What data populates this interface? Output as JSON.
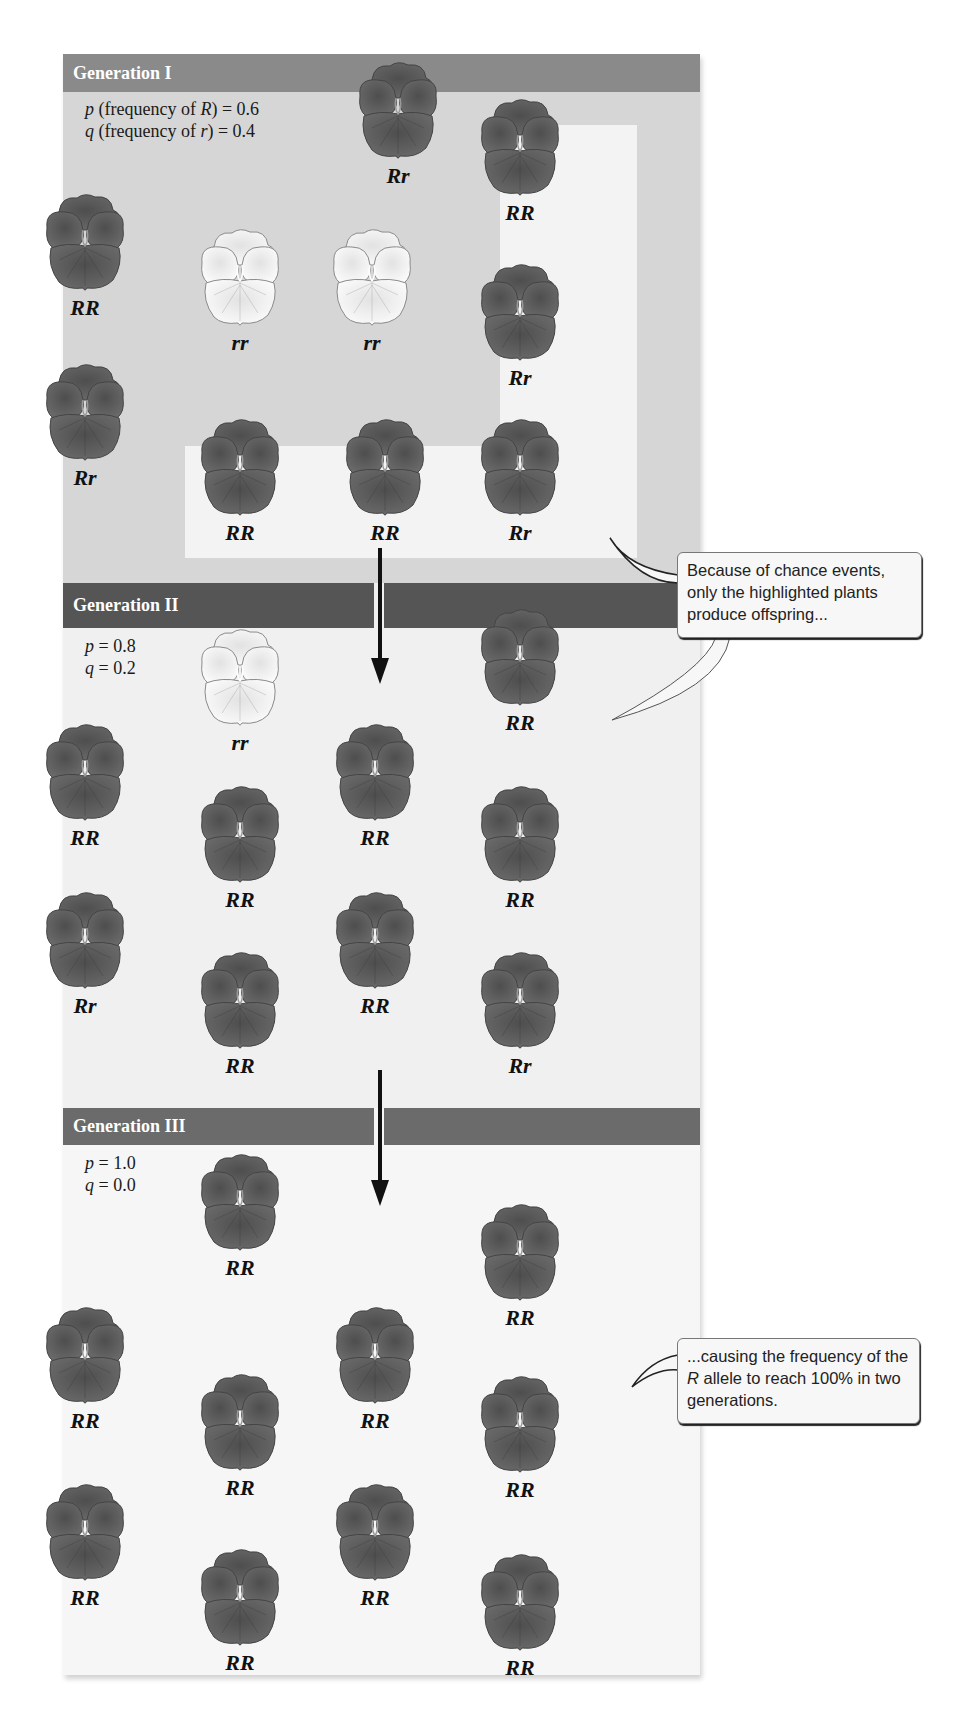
{
  "figure": {
    "generations": [
      {
        "title": "Generation I",
        "p_line": {
          "var": "p",
          "text": " (frequency of ",
          "allele": "R",
          "value": ") = 0.6"
        },
        "q_line": {
          "var": "q",
          "text": " (frequency of ",
          "allele": "r",
          "value": ") = 0.4"
        },
        "p": 0.6,
        "q": 0.4,
        "plants": [
          {
            "genotype": "Rr",
            "highlighted": false
          },
          {
            "genotype": "RR",
            "highlighted": true
          },
          {
            "genotype": "RR",
            "highlighted": false
          },
          {
            "genotype": "rr",
            "highlighted": false
          },
          {
            "genotype": "rr",
            "highlighted": false
          },
          {
            "genotype": "Rr",
            "highlighted": true
          },
          {
            "genotype": "Rr",
            "highlighted": false
          },
          {
            "genotype": "RR",
            "highlighted": true
          },
          {
            "genotype": "RR",
            "highlighted": true
          },
          {
            "genotype": "Rr",
            "highlighted": true
          }
        ]
      },
      {
        "title": "Generation II",
        "p_line": {
          "var": "p",
          "value": " = 0.8"
        },
        "q_line": {
          "var": "q",
          "value": " = 0.2"
        },
        "p": 0.8,
        "q": 0.2,
        "plants": [
          {
            "genotype": "rr"
          },
          {
            "genotype": "RR"
          },
          {
            "genotype": "RR"
          },
          {
            "genotype": "RR"
          },
          {
            "genotype": "RR"
          },
          {
            "genotype": "RR"
          },
          {
            "genotype": "Rr"
          },
          {
            "genotype": "RR"
          },
          {
            "genotype": "RR"
          },
          {
            "genotype": "Rr"
          }
        ]
      },
      {
        "title": "Generation III",
        "p_line": {
          "var": "p",
          "value": " = 1.0"
        },
        "q_line": {
          "var": "q",
          "value": " = 0.0"
        },
        "p": 1.0,
        "q": 0.0,
        "plants": [
          {
            "genotype": "RR"
          },
          {
            "genotype": "RR"
          },
          {
            "genotype": "RR"
          },
          {
            "genotype": "RR"
          },
          {
            "genotype": "RR"
          },
          {
            "genotype": "RR"
          },
          {
            "genotype": "RR"
          },
          {
            "genotype": "RR"
          },
          {
            "genotype": "RR"
          },
          {
            "genotype": "RR"
          }
        ]
      }
    ],
    "callouts": [
      {
        "text": "Because of chance events, only the highlighted plants produce offspring..."
      },
      {
        "text_before": "...causing the frequency of the ",
        "allele": "R",
        "text_after": " allele to reach 100% in two generations."
      }
    ],
    "colors": {
      "dark_flower": "#5a5a5a",
      "light_flower": "#f4f4f4",
      "gen1_header": "#8a8a8a",
      "gen2_header": "#555555",
      "gen3_header": "#6b6b6b",
      "gen1_background": "#d6d6d6",
      "highlight_background": "#f3f3f3"
    }
  }
}
